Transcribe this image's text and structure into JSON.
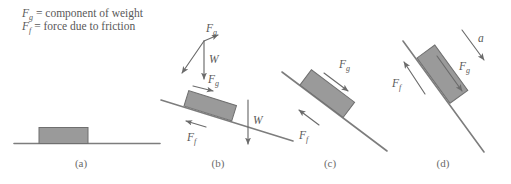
{
  "figure": {
    "background_color": "#ffffff",
    "line_color": "#7d7d7d",
    "block_fill_color": "#9a9a9a",
    "block_stroke_color": "#6f6f6f",
    "arrow_color": "#6b6b6b",
    "text_color": "#595959"
  },
  "legend": {
    "lines": [
      {
        "symbol": "F",
        "subscript": "g",
        "equals": "=",
        "definition": "component of weight"
      },
      {
        "symbol": "F",
        "subscript": "f",
        "equals": "=",
        "definition": "force due to friction"
      }
    ],
    "line1_full": "Fg = component of weight",
    "line2_full": "Ff = force due to friction"
  },
  "panels": [
    {
      "id": "a",
      "label": "(a)",
      "incline_angle_deg": 0,
      "description": "Block at rest on a horizontal surface, no force vectors shown",
      "vectors": []
    },
    {
      "id": "b",
      "label": "(b)",
      "incline_angle_deg": 17,
      "description": "Block on a shallow incline with weight decomposed into components",
      "vectors": [
        {
          "name": "F_g",
          "symbol": "F",
          "subscript": "g",
          "placement": "decomposition-top",
          "direction": "down-slope"
        },
        {
          "name": "W",
          "symbol": "W",
          "subscript": "",
          "placement": "decomposition-top",
          "direction": "straight-down"
        },
        {
          "name": "F_g",
          "symbol": "F",
          "subscript": "g",
          "placement": "above-block",
          "direction": "down-slope"
        },
        {
          "name": "F_f",
          "symbol": "F",
          "subscript": "f",
          "placement": "below-block",
          "direction": "up-slope"
        },
        {
          "name": "W",
          "symbol": "W",
          "subscript": "",
          "placement": "right-of-incline",
          "direction": "straight-down"
        }
      ]
    },
    {
      "id": "c",
      "label": "(c)",
      "incline_angle_deg": 33,
      "description": "Block on a steeper incline, larger down-slope component",
      "vectors": [
        {
          "name": "F_g",
          "symbol": "F",
          "subscript": "g",
          "placement": "above-block",
          "direction": "down-slope"
        },
        {
          "name": "F_f",
          "symbol": "F",
          "subscript": "f",
          "placement": "below-block",
          "direction": "up-slope"
        }
      ]
    },
    {
      "id": "d",
      "label": "(d)",
      "incline_angle_deg": 53,
      "description": "Block sliding on the steepest incline with acceleration",
      "vectors": [
        {
          "name": "a",
          "symbol": "a",
          "subscript": "",
          "placement": "top-right",
          "direction": "down-slope"
        },
        {
          "name": "F_g",
          "symbol": "F",
          "subscript": "g",
          "placement": "right-of-block",
          "direction": "down-slope"
        },
        {
          "name": "F_f",
          "symbol": "F",
          "subscript": "f",
          "placement": "left-of-block",
          "direction": "up-slope"
        }
      ]
    }
  ],
  "labels": {
    "Fg": "F",
    "Fg_sub": "g",
    "Ff": "F",
    "Ff_sub": "f",
    "W": "W",
    "a": "a"
  }
}
